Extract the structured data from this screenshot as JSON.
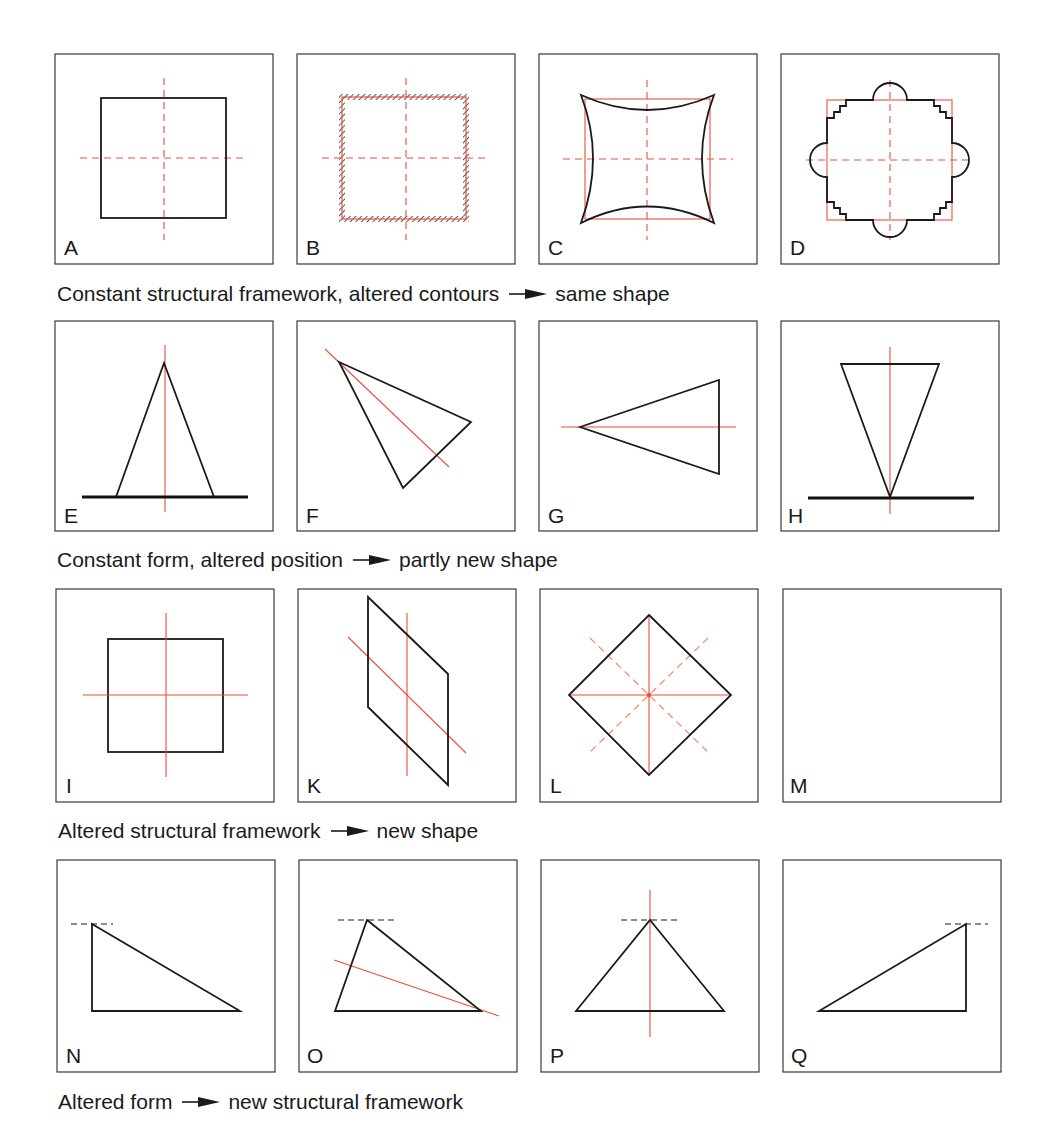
{
  "figure": {
    "colors": {
      "structure_red": "#e8503a",
      "structure_dashed_soft": "#ef8a6a",
      "outline_black": "#1a1a1a",
      "frame": "#3a3a3a"
    },
    "rows": [
      {
        "caption": {
          "premise": "Constant structural framework, altered contours",
          "arrow_icon": "right-arrow-icon",
          "result": "same shape"
        },
        "panels": [
          {
            "label": "A",
            "description": "Square with dashed red central axes"
          },
          {
            "label": "B",
            "description": "Square with hatched contour and dashed red central axes"
          },
          {
            "label": "C",
            "description": "Concave-sided square over red square framework with dashed axes"
          },
          {
            "label": "D",
            "description": "Stepped-corner square with semicircular bumps over red square framework with dashed axes"
          }
        ]
      },
      {
        "caption": {
          "premise": "Constant form, altered position",
          "arrow_icon": "right-arrow-icon",
          "result": "partly new shape"
        },
        "panels": [
          {
            "label": "E",
            "description": "Isosceles triangle standing on a ground line with red vertical axis"
          },
          {
            "label": "F",
            "description": "Same triangle rotated with tilted red axis"
          },
          {
            "label": "G",
            "description": "Same triangle pointing left with horizontal red axis"
          },
          {
            "label": "H",
            "description": "Inverted triangle balanced on apex on ground line with red vertical axis"
          }
        ]
      },
      {
        "caption": {
          "premise": "Altered structural framework",
          "arrow_icon": "right-arrow-icon",
          "result": "new shape"
        },
        "panels": [
          {
            "label": "I",
            "description": "Square with solid red central axes"
          },
          {
            "label": "K",
            "description": "Parallelogram with red vertical and tilted axes"
          },
          {
            "label": "L",
            "description": "Diamond with red vertical/horizontal axes and dashed diagonals"
          },
          {
            "label": "M",
            "description": "Empty panel"
          }
        ]
      },
      {
        "caption": {
          "premise": "Altered form",
          "arrow_icon": "right-arrow-icon",
          "result": "new structural framework"
        },
        "panels": [
          {
            "label": "N",
            "description": "Right triangle with apex at upper left and dashed level line"
          },
          {
            "label": "O",
            "description": "Scalene triangle with dashed level line and tilted red axis"
          },
          {
            "label": "P",
            "description": "Isosceles triangle with dashed level line and red vertical axis"
          },
          {
            "label": "Q",
            "description": "Right triangle with apex at upper right and dashed level line"
          }
        ]
      }
    ]
  }
}
